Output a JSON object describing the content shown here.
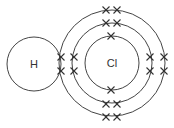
{
  "diagram": {
    "type": "dot-and-cross",
    "molecule": "HCl",
    "atoms": [
      {
        "symbol": "H",
        "cx": 34,
        "cy": 64,
        "r": 27
      },
      {
        "symbol": "Cl",
        "cx": 112,
        "cy": 63,
        "shells": [
          27,
          40,
          53
        ]
      }
    ],
    "electrons": [
      {
        "x": 61,
        "y": 57
      },
      {
        "x": 61,
        "y": 71
      },
      {
        "x": 74,
        "y": 57
      },
      {
        "x": 74,
        "y": 71
      },
      {
        "x": 150,
        "y": 57
      },
      {
        "x": 150,
        "y": 71
      },
      {
        "x": 164,
        "y": 57
      },
      {
        "x": 164,
        "y": 71
      },
      {
        "x": 106,
        "y": 10
      },
      {
        "x": 117,
        "y": 10
      },
      {
        "x": 106,
        "y": 23
      },
      {
        "x": 117,
        "y": 23
      },
      {
        "x": 111,
        "y": 36
      },
      {
        "x": 111,
        "y": 90
      },
      {
        "x": 106,
        "y": 104
      },
      {
        "x": 117,
        "y": 104
      },
      {
        "x": 106,
        "y": 117
      },
      {
        "x": 117,
        "y": 117
      }
    ]
  }
}
